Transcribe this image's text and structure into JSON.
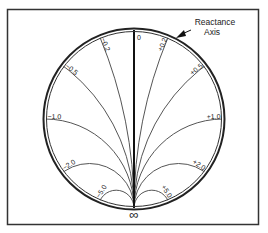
{
  "diagram": {
    "frame": {
      "x": 7.5,
      "y": 9.5,
      "width": 251,
      "height": 215,
      "stroke": "#333333"
    },
    "circle": {
      "cx": 134,
      "cy": 119,
      "r": 89,
      "outer_stroke": "#222222",
      "inner_stroke": "#333333"
    },
    "center_axis_label": "0",
    "infinity_label": "∞",
    "callout": {
      "line1": "Reactance",
      "line2": "Axis",
      "arrow": "arrow-icon"
    },
    "arcs": [
      {
        "x": 0.2,
        "label": "+0.2"
      },
      {
        "x": 0.5,
        "label": "+0.5"
      },
      {
        "x": 1.0,
        "label": "+1.0"
      },
      {
        "x": 2.0,
        "label": "+2.0"
      },
      {
        "x": 5.0,
        "label": "+5.0"
      },
      {
        "x": -0.2,
        "label": "−0.2"
      },
      {
        "x": -0.5,
        "label": "−0.5"
      },
      {
        "x": -1.0,
        "label": "−1.0"
      },
      {
        "x": -2.0,
        "label": "−2.0"
      },
      {
        "x": -5.0,
        "label": "−5.0"
      }
    ],
    "colors": {
      "arc": "#555555",
      "axis": "#111111",
      "text": "#222222"
    }
  }
}
